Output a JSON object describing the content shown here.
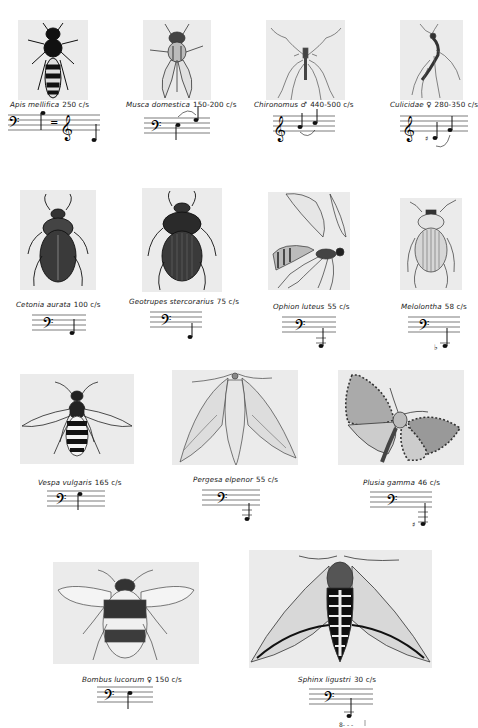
{
  "page": {
    "background": "#ffffff",
    "plate_color": "#ebebeb"
  },
  "specimens": [
    {
      "name": "Apis mellifica",
      "sex": "",
      "frequency": "250 c/s",
      "clef": "bass=treble",
      "illustration": "honey-bee"
    },
    {
      "name": "Musca domestica",
      "sex": "",
      "frequency": "150-200 c/s",
      "clef": "bass",
      "illustration": "house-fly"
    },
    {
      "name": "Chironomus",
      "sex": "♂",
      "frequency": "440-500 c/s",
      "clef": "treble",
      "illustration": "midge"
    },
    {
      "name": "Culicidae",
      "sex": "♀",
      "frequency": "280-350 c/s",
      "clef": "treble",
      "illustration": "mosquito"
    },
    {
      "name": "Cetonia aurata",
      "sex": "",
      "frequency": "100 c/s",
      "clef": "bass",
      "illustration": "rose-chafer"
    },
    {
      "name": "Geotrupes stercorarius",
      "sex": "",
      "frequency": "75 c/s",
      "clef": "bass",
      "illustration": "dung-beetle"
    },
    {
      "name": "Ophion luteus",
      "sex": "",
      "frequency": "55 c/s",
      "clef": "bass",
      "illustration": "ichneumon-wasp"
    },
    {
      "name": "Melolontha",
      "sex": "",
      "frequency": "58 c/s",
      "clef": "bass",
      "illustration": "cockchafer"
    },
    {
      "name": "Vespa vulgaris",
      "sex": "",
      "frequency": "165 c/s",
      "clef": "bass",
      "illustration": "common-wasp"
    },
    {
      "name": "Pergesa elpenor",
      "sex": "",
      "frequency": "55 c/s",
      "clef": "bass",
      "illustration": "elephant-hawk-moth"
    },
    {
      "name": "Plusia gamma",
      "sex": "",
      "frequency": "46 c/s",
      "clef": "bass",
      "illustration": "silver-y-moth"
    },
    {
      "name": "Bombus lucorum",
      "sex": "♀",
      "frequency": "150 c/s",
      "clef": "bass",
      "illustration": "bumblebee"
    },
    {
      "name": "Sphinx ligustri",
      "sex": "",
      "frequency": "30 c/s",
      "clef": "bass",
      "octave_marking": "8- - -",
      "illustration": "privet-hawk-moth"
    }
  ]
}
